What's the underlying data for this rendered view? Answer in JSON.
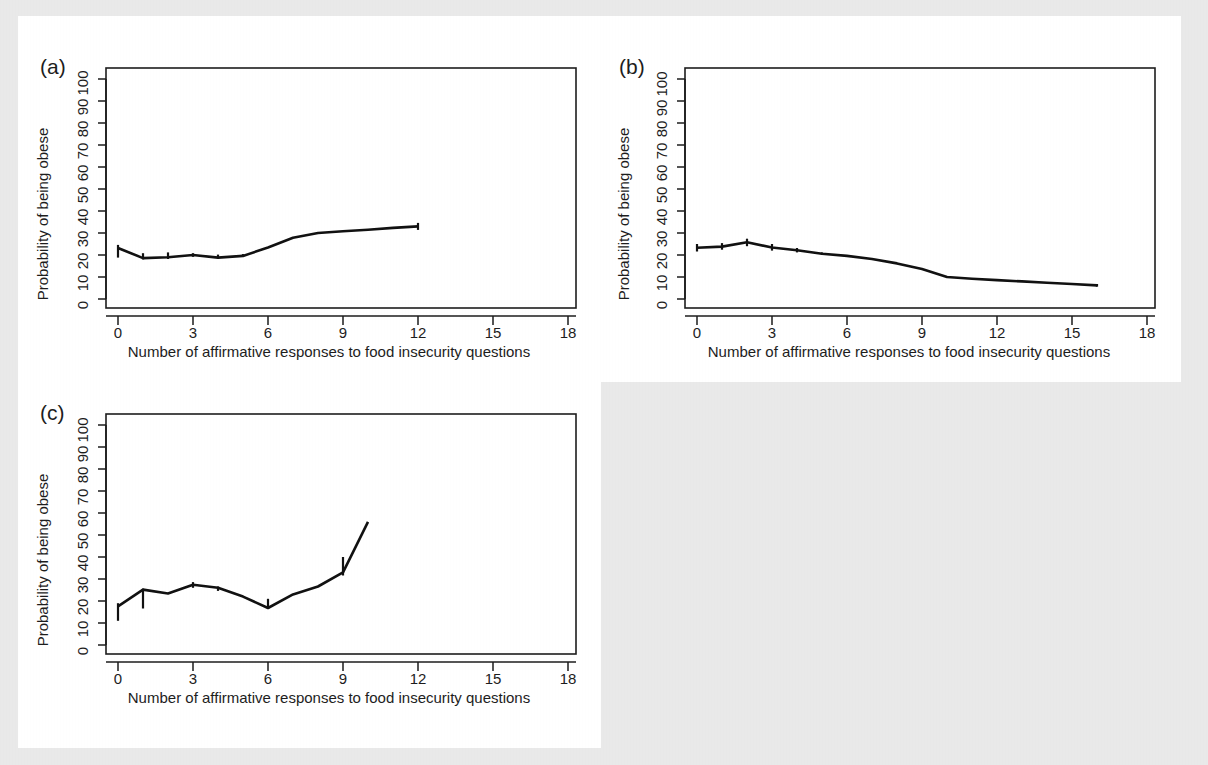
{
  "figure": {
    "background_color": "#e9e9e9",
    "panel_background_color": "#ffffff",
    "line_color": "#111111",
    "text_color": "#1d1d1d",
    "panels": [
      "a",
      "b",
      "c"
    ]
  },
  "labels": {
    "panel_a": "(a)",
    "panel_b": "(b)",
    "panel_c": "(c)",
    "xlabel": "Number of affirmative responses to food insecurity questions",
    "ylabel": "Probability of being obese",
    "xticks": [
      "0",
      "3",
      "6",
      "9",
      "12",
      "15",
      "18"
    ],
    "yticks": [
      "0",
      "10",
      "20",
      "30",
      "40",
      "50",
      "60",
      "70",
      "80",
      "90",
      "100"
    ]
  },
  "chart_data": [
    {
      "type": "line",
      "panel": "a",
      "title": "(a)",
      "xlabel": "Number of affirmative responses to food insecurity questions",
      "ylabel": "Probability of being obese",
      "xlim": [
        0,
        18
      ],
      "ylim": [
        0,
        100
      ],
      "xticks": [
        0,
        3,
        6,
        9,
        12,
        15,
        18
      ],
      "yticks": [
        0,
        10,
        20,
        30,
        40,
        50,
        60,
        70,
        80,
        90,
        100
      ],
      "grid": false,
      "legend": "none",
      "x": [
        0,
        1,
        2,
        3,
        4,
        5,
        6,
        7,
        8,
        9,
        10,
        11,
        12
      ],
      "values": [
        23.2,
        18.6,
        19.0,
        20.0,
        18.8,
        19.6,
        23.4,
        27.8,
        30.0,
        30.8,
        31.5,
        32.3,
        33.0
      ],
      "error_bars": [
        {
          "x": 0,
          "low": 18.8,
          "high": 24.6
        },
        {
          "x": 1,
          "low": 18.0,
          "high": 20.8
        },
        {
          "x": 2,
          "low": 18.2,
          "high": 21.2
        },
        {
          "x": 3,
          "low": 19.2,
          "high": 20.8
        },
        {
          "x": 4,
          "low": 18.4,
          "high": 20.2
        },
        {
          "x": 5,
          "low": 19.4,
          "high": 20.4
        },
        {
          "x": 12,
          "low": 31.4,
          "high": 34.6
        }
      ]
    },
    {
      "type": "line",
      "panel": "b",
      "title": "(b)",
      "xlabel": "Number of affirmative responses to food insecurity questions",
      "ylabel": "Probability of being obese",
      "xlim": [
        0,
        18
      ],
      "ylim": [
        0,
        100
      ],
      "xticks": [
        0,
        3,
        6,
        9,
        12,
        15,
        18
      ],
      "yticks": [
        0,
        10,
        20,
        30,
        40,
        50,
        60,
        70,
        80,
        90,
        100
      ],
      "grid": false,
      "legend": "none",
      "x": [
        0,
        1,
        2,
        3,
        4,
        5,
        6,
        7,
        8,
        9,
        10,
        11,
        12,
        13,
        14,
        15,
        16
      ],
      "values": [
        23.3,
        23.8,
        25.8,
        23.4,
        22.2,
        20.6,
        19.6,
        18.2,
        16.2,
        13.6,
        10.0,
        9.2,
        8.6,
        8.0,
        7.4,
        6.8,
        6.2
      ],
      "error_bars": [
        {
          "x": 0,
          "low": 21.6,
          "high": 25.0
        },
        {
          "x": 1,
          "low": 22.4,
          "high": 25.4
        },
        {
          "x": 2,
          "low": 24.0,
          "high": 27.4
        },
        {
          "x": 3,
          "low": 22.0,
          "high": 25.0
        },
        {
          "x": 4,
          "low": 21.2,
          "high": 23.2
        },
        {
          "x": 5,
          "low": 20.0,
          "high": 21.2
        },
        {
          "x": 16,
          "low": 5.6,
          "high": 6.8
        }
      ]
    },
    {
      "type": "line",
      "panel": "c",
      "title": "(c)",
      "xlabel": "Number of affirmative responses to food insecurity questions",
      "ylabel": "Probability of being obese",
      "xlim": [
        0,
        18
      ],
      "ylim": [
        0,
        100
      ],
      "xticks": [
        0,
        3,
        6,
        9,
        12,
        15,
        18
      ],
      "yticks": [
        0,
        10,
        20,
        30,
        40,
        50,
        60,
        70,
        80,
        90,
        100
      ],
      "grid": false,
      "legend": "none",
      "x": [
        0,
        1,
        2,
        3,
        4,
        5,
        6,
        7,
        8,
        9,
        10
      ],
      "values": [
        17.6,
        25.2,
        23.4,
        27.4,
        26.0,
        22.0,
        16.8,
        23.0,
        26.6,
        33.0,
        56.0
      ],
      "error_bars": [
        {
          "x": 0,
          "low": 11.0,
          "high": 19.0
        },
        {
          "x": 1,
          "low": 16.6,
          "high": 25.6
        },
        {
          "x": 3,
          "low": 26.0,
          "high": 28.6
        },
        {
          "x": 4,
          "low": 24.6,
          "high": 26.6
        },
        {
          "x": 6,
          "low": 16.4,
          "high": 21.0
        },
        {
          "x": 9,
          "low": 31.6,
          "high": 40.0
        }
      ]
    }
  ]
}
